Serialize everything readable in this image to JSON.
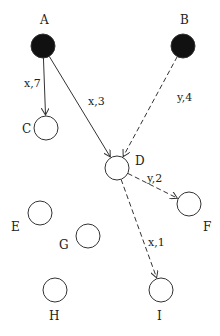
{
  "diagram": {
    "nodes": [
      {
        "id": "A",
        "label": "A",
        "filled": true,
        "cx": 43,
        "cy": 46,
        "lx": 40,
        "ly": 24
      },
      {
        "id": "B",
        "label": "B",
        "filled": true,
        "cx": 183,
        "cy": 46,
        "lx": 180,
        "ly": 24
      },
      {
        "id": "C",
        "label": "C",
        "filled": false,
        "cx": 46,
        "cy": 128,
        "lx": 22,
        "ly": 133
      },
      {
        "id": "D",
        "label": "D",
        "filled": false,
        "cx": 117,
        "cy": 168,
        "lx": 135,
        "ly": 165
      },
      {
        "id": "F",
        "label": "F",
        "filled": false,
        "cx": 189,
        "cy": 204,
        "lx": 203,
        "ly": 231
      },
      {
        "id": "E",
        "label": "E",
        "filled": false,
        "cx": 40,
        "cy": 213,
        "lx": 11,
        "ly": 231
      },
      {
        "id": "G",
        "label": "G",
        "filled": false,
        "cx": 88,
        "cy": 236,
        "lx": 59,
        "ly": 249
      },
      {
        "id": "H",
        "label": "H",
        "filled": false,
        "cx": 55,
        "cy": 290,
        "lx": 49,
        "ly": 320
      },
      {
        "id": "I",
        "label": "I",
        "filled": false,
        "cx": 161,
        "cy": 290,
        "lx": 157,
        "ly": 320
      }
    ],
    "edges": [
      {
        "from": "A",
        "to": "C",
        "label": "x,7",
        "style": "solid",
        "lx": 24,
        "ly": 87
      },
      {
        "from": "A",
        "to": "D",
        "label": "x,3",
        "style": "solid",
        "lx": 88,
        "ly": 105
      },
      {
        "from": "B",
        "to": "D",
        "label": "y,4",
        "style": "dashed",
        "lx": 177,
        "ly": 101
      },
      {
        "from": "D",
        "to": "F",
        "label": "y,2",
        "style": "dashed",
        "lx": 147,
        "ly": 182
      },
      {
        "from": "D",
        "to": "I",
        "label": "x,1",
        "style": "dashed",
        "lx": 148,
        "ly": 246
      }
    ],
    "colors": {
      "filled": "#111111",
      "stroke": "#333333",
      "background": "#ffffff"
    }
  }
}
